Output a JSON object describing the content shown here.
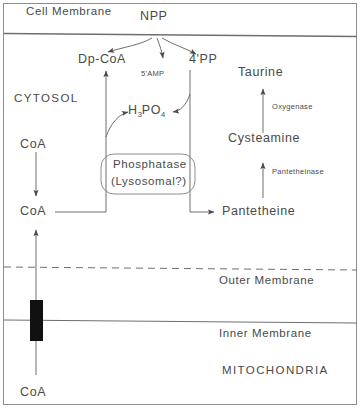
{
  "diagram": {
    "title_membrane": "Cell  Membrane",
    "compartments": {
      "cytosol": "CYTOSOL",
      "mitochondria": "MITOCHONDRIA"
    },
    "membranes": {
      "cell": "Cell  Membrane",
      "outer": "Outer  Membrane",
      "inner": "Inner  Membrane"
    },
    "metabolites": {
      "npp": "NPP",
      "dp_coa": "Dp-CoA",
      "four_pp": "4'PP",
      "amp": "5'AMP",
      "phosphoric_acid_main": "H",
      "phosphoric_acid_s1": "3",
      "phosphoric_acid_mid": "PO",
      "phosphoric_acid_s2": "4",
      "taurine": "Taurine",
      "cysteamine": "Cysteamine",
      "pantetheine": "Pantetheine",
      "coa_top": "CoA",
      "coa_mid": "CoA",
      "coa_bottom": "CoA"
    },
    "enzymes": {
      "phosphatase_line1": "Phosphatase",
      "phosphatase_line2": "(Lysosomal?)",
      "oxygenase": "Oxygenase",
      "pantetheinase": "Pantetheinase"
    },
    "colors": {
      "ink": "#4a4a4a",
      "line": "#6f6f6f",
      "frame": "#8d8d8d",
      "transporter": "#111111",
      "background": "#ffffff"
    }
  }
}
